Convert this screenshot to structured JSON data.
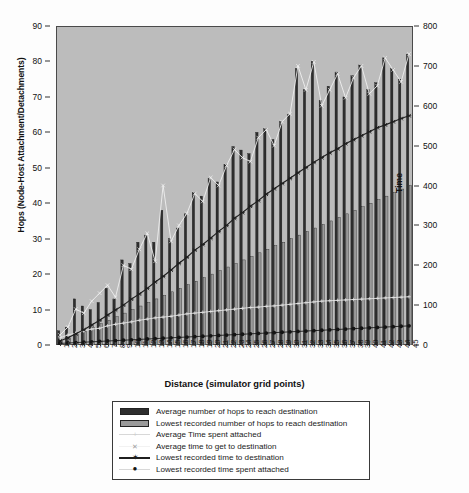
{
  "chart_data": {
    "type": "bar",
    "title": "",
    "xlabel": "Distance (simulator grid points)",
    "ylabel": "Hops (Node-Host Attachment/Detachments)",
    "ylabel_secondary": "Time",
    "ylim": [
      0,
      90
    ],
    "ylim_secondary": [
      0,
      800
    ],
    "yticks": [
      0,
      10,
      20,
      30,
      40,
      50,
      60,
      70,
      80,
      90
    ],
    "yticks_secondary": [
      0,
      100,
      200,
      300,
      400,
      500,
      600,
      700,
      800
    ],
    "grid": false,
    "legend_position": "below",
    "plot_background": "#bcbcbc",
    "categories": [
      1,
      2,
      3,
      4,
      5,
      6,
      7,
      8,
      9,
      10,
      11,
      12,
      13,
      14,
      15,
      16,
      17,
      18,
      19,
      20,
      21,
      22,
      23,
      24,
      25,
      26,
      27,
      28,
      29,
      30,
      31,
      32,
      33,
      34,
      35,
      36,
      37,
      38,
      39,
      40,
      41,
      42,
      43,
      44,
      45
    ],
    "series": [
      {
        "name": "Average number of hops to reach destination",
        "kind": "bar",
        "axis": "left",
        "color": "#2e2e2e",
        "values": [
          4,
          5,
          13,
          11,
          10,
          12,
          16,
          13,
          24,
          23,
          29,
          31,
          29,
          38,
          30,
          33,
          37,
          43,
          42,
          47,
          46,
          51,
          56,
          55,
          54,
          60,
          61,
          58,
          63,
          65,
          78,
          72,
          80,
          69,
          73,
          77,
          70,
          76,
          79,
          72,
          74,
          81,
          78,
          75,
          82
        ]
      },
      {
        "name": "Lowest recorded number of hops to reach destination",
        "kind": "bar",
        "axis": "left",
        "color": "#9a9a9a",
        "values": [
          1,
          2,
          3,
          4,
          5,
          6,
          7,
          8,
          9,
          10,
          11,
          12,
          13,
          14,
          15,
          16,
          17,
          18,
          19,
          20,
          21,
          22,
          23,
          24,
          25,
          26,
          27,
          28,
          29,
          30,
          31,
          32,
          33,
          34,
          35,
          36,
          37,
          38,
          39,
          40,
          41,
          42,
          43,
          44,
          45
        ]
      },
      {
        "name": "Average Time spent attached",
        "kind": "line",
        "axis": "right",
        "color": "#e8e8e8",
        "marker": "plus",
        "values": [
          18,
          25,
          30,
          35,
          40,
          42,
          48,
          52,
          55,
          58,
          62,
          65,
          68,
          70,
          72,
          75,
          78,
          80,
          82,
          84,
          86,
          88,
          90,
          92,
          94,
          95,
          97,
          98,
          100,
          102,
          104,
          106,
          108,
          110,
          111,
          112,
          113,
          114,
          115,
          116,
          117,
          118,
          119,
          120,
          121
        ]
      },
      {
        "name": "Average time to get to destination",
        "kind": "line",
        "axis": "right",
        "color": "#f2f2f2",
        "marker": "x",
        "values": [
          25,
          45,
          90,
          80,
          110,
          130,
          150,
          120,
          200,
          190,
          240,
          280,
          210,
          400,
          260,
          300,
          330,
          380,
          360,
          420,
          400,
          450,
          490,
          470,
          460,
          520,
          540,
          500,
          560,
          580,
          700,
          640,
          710,
          600,
          640,
          680,
          620,
          670,
          700,
          630,
          650,
          720,
          690,
          660,
          730
        ]
      },
      {
        "name": "Lowest recorded time to destination",
        "kind": "line",
        "axis": "right",
        "color": "#1f1f1f",
        "marker": "star",
        "values": [
          10,
          18,
          28,
          38,
          50,
          62,
          75,
          88,
          100,
          115,
          128,
          142,
          158,
          172,
          188,
          205,
          220,
          238,
          252,
          268,
          285,
          300,
          318,
          332,
          348,
          362,
          378,
          392,
          405,
          418,
          432,
          445,
          458,
          470,
          482,
          492,
          505,
          515,
          525,
          535,
          545,
          552,
          560,
          568,
          575
        ]
      },
      {
        "name": "Lowest recorded time spent attached",
        "kind": "line",
        "axis": "right",
        "color": "#141414",
        "marker": "circle",
        "values": [
          4,
          5,
          6,
          7,
          8,
          9,
          10,
          11,
          12,
          13,
          14,
          15,
          16,
          17,
          18,
          19,
          20,
          21,
          22,
          23,
          24,
          25,
          26,
          27,
          28,
          29,
          30,
          31,
          32,
          33,
          34,
          35,
          36,
          37,
          38,
          39,
          40,
          41,
          42,
          43,
          44,
          45,
          46,
          47,
          48
        ]
      }
    ]
  },
  "axes": {
    "left_title": "Hops (Node-Host Attachment/Detachments)",
    "right_title": "Time",
    "bottom_title": "Distance (simulator grid points)"
  }
}
